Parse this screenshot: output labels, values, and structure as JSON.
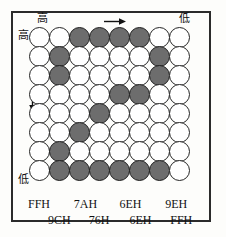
{
  "figure": {
    "type": "dot-matrix-grid",
    "rows": 8,
    "cols": 8,
    "on_color": "#6d6d6d",
    "off_color": "#ffffff",
    "border_color": "#242424"
  },
  "labels": {
    "top_left": "高",
    "top_right": "低",
    "left_top": "高",
    "left_bottom": "低",
    "arrow_right": "right-arrow",
    "arrow_down": "down-arrow"
  },
  "hex_rows": {
    "line1": [
      "FFH",
      "7AH",
      "6EH",
      "9EH"
    ],
    "line2": [
      "9CH",
      "76H",
      "6EH",
      "FFH"
    ]
  },
  "grid_data": {
    "type": "heatmap",
    "description": "8x8 dot matrix bit pattern; 1 = dark/lit dot, 0 = white/unlit dot",
    "matrix": [
      [
        0,
        0,
        1,
        1,
        1,
        1,
        0,
        0
      ],
      [
        0,
        1,
        0,
        0,
        0,
        0,
        1,
        0
      ],
      [
        0,
        1,
        0,
        0,
        0,
        0,
        1,
        0
      ],
      [
        0,
        0,
        0,
        0,
        1,
        1,
        0,
        0
      ],
      [
        0,
        0,
        0,
        1,
        0,
        0,
        0,
        0
      ],
      [
        0,
        0,
        1,
        0,
        0,
        0,
        0,
        0
      ],
      [
        0,
        1,
        0,
        0,
        0,
        0,
        0,
        0
      ],
      [
        0,
        1,
        1,
        1,
        1,
        1,
        1,
        0
      ]
    ]
  }
}
